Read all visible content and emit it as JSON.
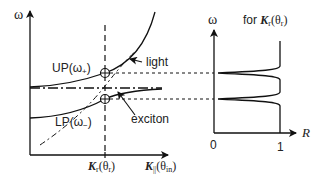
{
  "diagram": {
    "left_panel": {
      "y_axis_label": "ω",
      "x_axis_markers": [
        {
          "symbol": "K",
          "subscript": "r",
          "paren": "(θ",
          "paren_sub": "r",
          "paren_close": ")"
        },
        {
          "symbol": "K",
          "subscript": "||",
          "paren": "(θ",
          "paren_sub": "in",
          "paren_close": ")"
        }
      ],
      "curves": [
        {
          "name": "upper-polariton",
          "label": "UP(ω",
          "label_sub": "+",
          "label_close": ")"
        },
        {
          "name": "lower-polariton",
          "label": "LP(ω",
          "label_sub": "−",
          "label_close": ")"
        },
        {
          "name": "light",
          "label": "light",
          "style": "dash-dot"
        },
        {
          "name": "exciton",
          "label": "exciton",
          "style": "dash-dot"
        }
      ]
    },
    "right_panel": {
      "title_prefix": "for ",
      "title_symbol": "K",
      "title_sub": "r",
      "title_paren": "(θ",
      "title_paren_sub": "r",
      "title_paren_close": ")",
      "y_axis_label": "ω",
      "x_axis_label": "R",
      "x_ticks": [
        "0",
        "1"
      ]
    },
    "colors": {
      "line": "#111111",
      "background": "#ffffff"
    }
  }
}
